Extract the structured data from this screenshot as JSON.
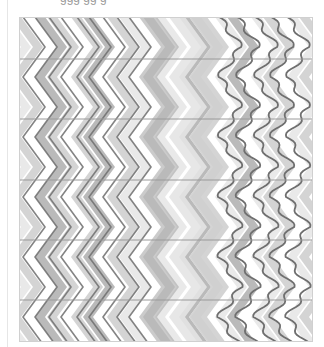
{
  "caption": {
    "text": "ggg        gg  g"
  },
  "figure": {
    "width": 294,
    "height": 325,
    "band_count": 5,
    "band_lines_y": [
      42,
      102,
      163,
      223,
      283
    ],
    "colors": {
      "background": "#ffffff",
      "light": "#e4e4e4",
      "mid": "#c9c9c9",
      "dark": "#a9a9a9",
      "line": "#6f6f6f",
      "band_line": "#9a9a9a"
    },
    "sections": [
      {
        "name": "left",
        "style": "thin dark zigzag lines over light chevrons",
        "x_range": [
          0,
          130
        ]
      },
      {
        "name": "middle",
        "style": "broad shaded chevron bands",
        "x_range": [
          130,
          200
        ]
      },
      {
        "name": "right",
        "style": "wavy zigzag lines over chevrons",
        "x_range": [
          200,
          294
        ]
      }
    ]
  }
}
